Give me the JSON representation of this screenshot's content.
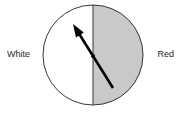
{
  "figure": {
    "type": "half-shaded-circle-with-vector",
    "background_color": "#ffffff"
  },
  "labels": {
    "left": "White",
    "right": "Red"
  },
  "circle": {
    "center_x": 93,
    "center_y": 55,
    "radius": 50,
    "stroke_color": "#231f20",
    "stroke_width": 0.9,
    "left_half_fill": "#ffffff",
    "right_half_fill": "#c9c9c9"
  },
  "divider": {
    "name": "vertical-diameter",
    "x": 93,
    "y_top": 5,
    "y_bottom": 105,
    "stroke_color": "#231f20",
    "stroke_width": 0.9
  },
  "vector": {
    "name": "direction-arrow",
    "tail_x": 113,
    "tail_y": 88,
    "tip_x": 73,
    "tip_y": 24,
    "stroke_color": "#000000",
    "stroke_width": 2.6,
    "arrowhead": "filled-triangle",
    "pivot_marker": "filled-diamond",
    "pivot_x": 93,
    "pivot_y": 56
  }
}
